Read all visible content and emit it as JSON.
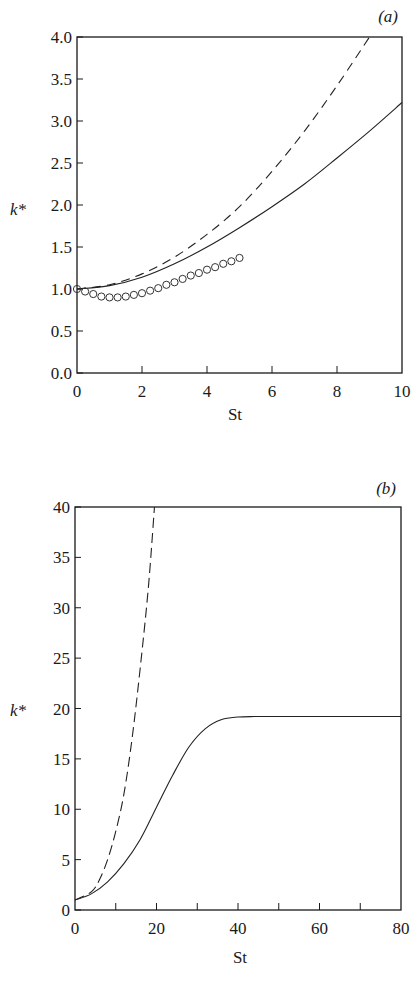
{
  "chart_data": [
    {
      "panel": "(a)",
      "type": "line",
      "xlabel": "St",
      "ylabel": "k*",
      "xlim": [
        0,
        10
      ],
      "ylim": [
        0.0,
        4.0
      ],
      "xticks": [
        "0",
        "2",
        "4",
        "6",
        "8",
        "10"
      ],
      "yticks": [
        "0.0",
        "0.5",
        "1.0",
        "1.5",
        "2.0",
        "2.5",
        "3.0",
        "3.5",
        "4.0"
      ],
      "grid": false,
      "legend": null,
      "series": [
        {
          "name": "solid",
          "style": "solid",
          "x": [
            0,
            1,
            2,
            3,
            4,
            5,
            6,
            7,
            8,
            9,
            10
          ],
          "y": [
            1.0,
            1.04,
            1.14,
            1.3,
            1.5,
            1.73,
            1.98,
            2.25,
            2.56,
            2.88,
            3.22
          ]
        },
        {
          "name": "dashed",
          "style": "dashed",
          "x": [
            0,
            1,
            2,
            3,
            4,
            5,
            6,
            7,
            8,
            9
          ],
          "y": [
            1.0,
            1.05,
            1.18,
            1.38,
            1.65,
            1.98,
            2.4,
            2.88,
            3.42,
            4.0
          ]
        },
        {
          "name": "circles",
          "style": "markers",
          "x": [
            0,
            0.25,
            0.5,
            0.75,
            1.0,
            1.25,
            1.5,
            1.75,
            2.0,
            2.25,
            2.5,
            2.75,
            3.0,
            3.25,
            3.5,
            3.75,
            4.0,
            4.25,
            4.5,
            4.75,
            5.0
          ],
          "y": [
            1.0,
            0.97,
            0.94,
            0.91,
            0.9,
            0.9,
            0.91,
            0.93,
            0.95,
            0.98,
            1.01,
            1.05,
            1.08,
            1.12,
            1.16,
            1.19,
            1.23,
            1.26,
            1.3,
            1.33,
            1.37
          ]
        }
      ]
    },
    {
      "panel": "(b)",
      "type": "line",
      "xlabel": "St",
      "ylabel": "k*",
      "xlim": [
        0,
        80
      ],
      "ylim": [
        0,
        40
      ],
      "xticks": [
        "0",
        "20",
        "40",
        "60",
        "80"
      ],
      "yticks": [
        "0",
        "5",
        "10",
        "15",
        "20",
        "25",
        "30",
        "35",
        "40"
      ],
      "grid": false,
      "legend": null,
      "series": [
        {
          "name": "solid",
          "style": "solid",
          "x": [
            0,
            4,
            8,
            12,
            16,
            20,
            24,
            28,
            32,
            36,
            40,
            44,
            50,
            60,
            70,
            80
          ],
          "y": [
            1.0,
            1.6,
            2.8,
            4.6,
            7.0,
            10.2,
            13.4,
            16.2,
            18.0,
            18.9,
            19.15,
            19.2,
            19.2,
            19.2,
            19.2,
            19.2
          ]
        },
        {
          "name": "dash-dot",
          "style": "dashed",
          "x": [
            0,
            4,
            6,
            8,
            10,
            12,
            14,
            16,
            18,
            19.5
          ],
          "y": [
            1.0,
            1.8,
            3.0,
            5.0,
            7.8,
            11.5,
            17.0,
            24.0,
            32.0,
            40.0
          ]
        }
      ]
    }
  ],
  "panels": {
    "a": {
      "label": "(a)",
      "xlabel": "St",
      "ylabel": "k*"
    },
    "b": {
      "label": "(b)",
      "xlabel": "St",
      "ylabel": "k*"
    }
  }
}
